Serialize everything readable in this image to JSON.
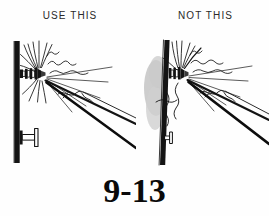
{
  "document": {
    "type": "technical-line-illustration",
    "figure_number": "9-13",
    "background_color": "#fefefe",
    "ink_color": "#111111",
    "shadow_color": "#b8b8b8"
  },
  "panels": [
    {
      "id": "use-this",
      "label": "USE THIS",
      "verdict": "correct",
      "description": "Soldering iron tip applied squarely to the terminal lug on the front face of the panel; heat stays at the joint.",
      "elements": {
        "panel_board": "vertical-black-panel",
        "terminal_upper": "binding-post-with-wires",
        "terminal_lower": "binding-post",
        "tool": "soldering-iron",
        "heat_indicator": "heat-wave-squiggles",
        "wires": "lead-wires",
        "damage_shadow": "none"
      }
    },
    {
      "id": "not-this",
      "label": "NOT THIS",
      "verdict": "incorrect",
      "description": "Soldering iron tip pressed against the panel itself; excess heat scorches and deforms the board behind the terminal.",
      "elements": {
        "panel_board": "vertical-black-panel",
        "terminal_upper": "binding-post-with-wires",
        "terminal_lower": "binding-post-recessed",
        "tool": "soldering-iron",
        "heat_indicator": "heat-wave-squiggles",
        "wires": "lead-wires",
        "damage_shadow": "gray-scorch-smudge"
      }
    }
  ]
}
